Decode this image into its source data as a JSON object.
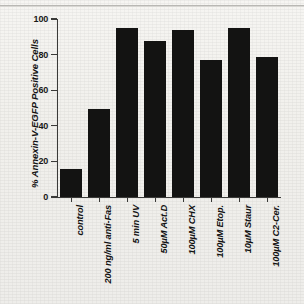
{
  "figure": {
    "kind": "scanned-bar-chart",
    "background_color": "#f2f1ee",
    "bar_color": "#131312",
    "axis_color": "#3a3a38",
    "top_rule_color": "#b9b8b4"
  },
  "chart_data": {
    "type": "bar",
    "title": "",
    "xlabel": "",
    "ylabel": "% Annexin-V-EGFP Positive Cells",
    "ylim": [
      0,
      100
    ],
    "yticks": [
      0,
      20,
      40,
      60,
      80,
      100
    ],
    "ytick_labels": [
      "0",
      "20",
      "40",
      "60",
      "80",
      "100"
    ],
    "grid": false,
    "legend": false,
    "categories": [
      "control",
      "200 ng/ml anti-Fas",
      "5 min UV",
      "50µM Act.D",
      "100µM CHX",
      "100µM Etop.",
      "10µM Staur",
      "100µM C2-Cer."
    ],
    "values": [
      15.8,
      49.3,
      95.2,
      87.4,
      94.0,
      77.0,
      95.0,
      78.5
    ]
  }
}
